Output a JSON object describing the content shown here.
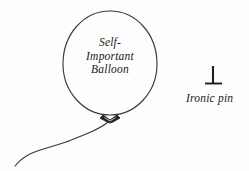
{
  "canvas": {
    "width": 249,
    "height": 171,
    "background_color": "#fdfdfd",
    "ink_color": "#2b2b2b",
    "title": "Self-Important Balloon and Ironic pin cartoon"
  },
  "balloon": {
    "label_lines": [
      "Self-",
      "Important",
      "Balloon"
    ],
    "label_full": "Self-Important Balloon",
    "outline_color": "#3a3a3a",
    "fill_color": "#fdfdfd",
    "knot_color": "#262626",
    "string_color": "#3a3a3a",
    "center_x": 110,
    "center_y": 64,
    "radius_x": 47,
    "radius_y": 53
  },
  "pin": {
    "label": "Ironic pin",
    "color": "#1f1f1f",
    "shaft_x": 213,
    "shaft_top_y": 66,
    "shaft_bottom_y": 83,
    "base_left_x": 205,
    "base_right_x": 222,
    "base_y": 83
  }
}
